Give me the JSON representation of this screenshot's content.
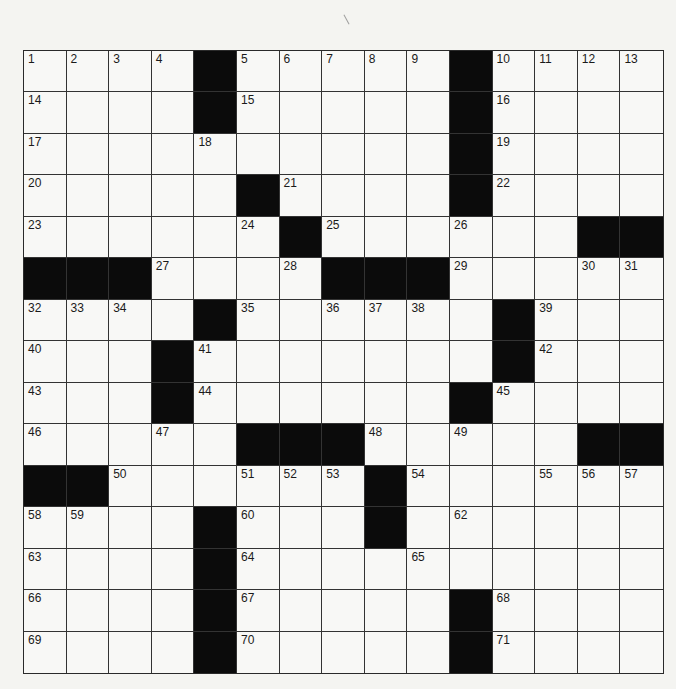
{
  "puzzle": {
    "rows": 15,
    "cols": 15,
    "colors": {
      "background": "#f4f4f1",
      "cell": "#f8f8f6",
      "block": "#0b0b0b",
      "line": "#333333",
      "number": "#1a1a1a"
    },
    "layout": [
      "....#.....#....",
      "....#.....#....",
      "..........#....",
      ".....#....#....",
      "......#......##",
      "###....###.....",
      "....#......#...",
      "...#.......#...",
      "...#......#....",
      ".....###.....##",
      "##......#......",
      "....#...#......",
      "....#..........",
      "....#.....#....",
      "....#.....#...."
    ],
    "numbers": [
      [
        1,
        2,
        3,
        4,
        0,
        5,
        6,
        7,
        8,
        9,
        0,
        10,
        11,
        12,
        13
      ],
      [
        14,
        0,
        0,
        0,
        0,
        15,
        0,
        0,
        0,
        0,
        0,
        16,
        0,
        0,
        0
      ],
      [
        17,
        0,
        0,
        0,
        18,
        0,
        0,
        0,
        0,
        0,
        0,
        19,
        0,
        0,
        0
      ],
      [
        20,
        0,
        0,
        0,
        0,
        0,
        21,
        0,
        0,
        0,
        0,
        22,
        0,
        0,
        0
      ],
      [
        23,
        0,
        0,
        0,
        0,
        24,
        0,
        25,
        0,
        0,
        26,
        0,
        0,
        0,
        0
      ],
      [
        0,
        0,
        0,
        27,
        0,
        0,
        28,
        0,
        0,
        0,
        29,
        0,
        0,
        30,
        31
      ],
      [
        32,
        33,
        34,
        0,
        0,
        35,
        0,
        36,
        37,
        38,
        0,
        0,
        39,
        0,
        0
      ],
      [
        40,
        0,
        0,
        0,
        41,
        0,
        0,
        0,
        0,
        0,
        0,
        0,
        42,
        0,
        0
      ],
      [
        43,
        0,
        0,
        0,
        44,
        0,
        0,
        0,
        0,
        0,
        0,
        45,
        0,
        0,
        0
      ],
      [
        46,
        0,
        0,
        47,
        0,
        0,
        0,
        0,
        48,
        0,
        49,
        0,
        0,
        0,
        0
      ],
      [
        0,
        0,
        50,
        0,
        0,
        51,
        52,
        53,
        0,
        54,
        0,
        0,
        55,
        56,
        57
      ],
      [
        58,
        59,
        0,
        0,
        0,
        60,
        0,
        0,
        61,
        0,
        62,
        0,
        0,
        0,
        0
      ],
      [
        63,
        0,
        0,
        0,
        0,
        64,
        0,
        0,
        0,
        65,
        0,
        0,
        0,
        0,
        0
      ],
      [
        66,
        0,
        0,
        0,
        0,
        67,
        0,
        0,
        0,
        0,
        0,
        68,
        0,
        0,
        0
      ],
      [
        69,
        0,
        0,
        0,
        0,
        70,
        0,
        0,
        0,
        0,
        0,
        71,
        0,
        0,
        0
      ]
    ]
  }
}
